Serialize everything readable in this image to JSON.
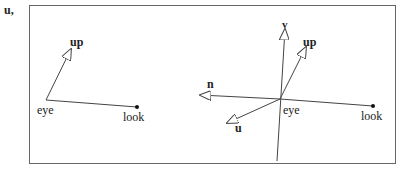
{
  "margin_label": "u,",
  "left_diagram": {
    "labels": {
      "up": "up",
      "eye": "eye",
      "look": "look"
    }
  },
  "right_diagram": {
    "labels": {
      "v": "v",
      "up": "up",
      "n": "n",
      "u": "u",
      "eye": "eye",
      "look": "look"
    }
  },
  "colors": {
    "stroke": "#444444",
    "frame": "#666666",
    "text": "#222222",
    "background": "#ffffff"
  }
}
